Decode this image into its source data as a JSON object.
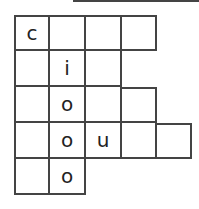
{
  "puzzle": {
    "title_line": "",
    "grid": [
      {
        "row": 0,
        "col": 0,
        "letter": "c"
      },
      {
        "row": 0,
        "col": 1,
        "letter": ""
      },
      {
        "row": 0,
        "col": 2,
        "letter": ""
      },
      {
        "row": 0,
        "col": 3,
        "letter": ""
      },
      {
        "row": 1,
        "col": 0,
        "letter": ""
      },
      {
        "row": 1,
        "col": 1,
        "letter": "i"
      },
      {
        "row": 1,
        "col": 2,
        "letter": ""
      },
      {
        "row": 1,
        "col": 3,
        "letter": ""
      },
      {
        "row": 2,
        "col": 0,
        "letter": ""
      },
      {
        "row": 2,
        "col": 1,
        "letter": "o"
      },
      {
        "row": 2,
        "col": 2,
        "letter": ""
      },
      {
        "row": 2,
        "col": 3,
        "letter": ""
      },
      {
        "row": 3,
        "col": 0,
        "letter": ""
      },
      {
        "row": 3,
        "col": 1,
        "letter": "o"
      },
      {
        "row": 3,
        "col": 2,
        "letter": "u"
      },
      {
        "row": 3,
        "col": 3,
        "letter": ""
      },
      {
        "row": 3,
        "col": 4,
        "letter": ""
      },
      {
        "row": 4,
        "col": 0,
        "letter": ""
      },
      {
        "row": 4,
        "col": 1,
        "letter": "o"
      }
    ]
  }
}
